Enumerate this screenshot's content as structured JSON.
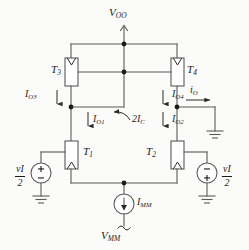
{
  "figure": {
    "type": "circuit-schematic",
    "background_color": "#fbfbf9",
    "line_color": "#5a5a5a",
    "text_color": "#1b1b1b"
  },
  "supplies": {
    "positive_rail": {
      "symbol": "V",
      "subscript": "OO"
    },
    "negative_rail": {
      "symbol": "V",
      "subscript": "MM"
    }
  },
  "transistors": [
    {
      "id": "T3",
      "symbol": "T",
      "subscript": "3",
      "position": "upper-left",
      "arrow": "top"
    },
    {
      "id": "T4",
      "symbol": "T",
      "subscript": "4",
      "position": "upper-right",
      "arrow": "top"
    },
    {
      "id": "T1",
      "symbol": "T",
      "subscript": "1",
      "position": "lower-left",
      "arrow": "bottom"
    },
    {
      "id": "T2",
      "symbol": "T",
      "subscript": "2",
      "position": "lower-right",
      "arrow": "bottom"
    }
  ],
  "currents": [
    {
      "id": "IO3",
      "symbol": "I",
      "subscript": "O3",
      "direction": "down"
    },
    {
      "id": "IO4",
      "symbol": "I",
      "subscript": "O4",
      "direction": "down"
    },
    {
      "id": "IO1",
      "symbol": "I",
      "subscript": "O1",
      "direction": "down"
    },
    {
      "id": "IO2",
      "symbol": "I",
      "subscript": "O2",
      "direction": "down"
    },
    {
      "id": "iO",
      "symbol": "i",
      "subscript": "O",
      "direction": "right"
    },
    {
      "id": "2IC",
      "symbol": "2I",
      "subscript": "C",
      "direction": "curved-left"
    },
    {
      "id": "IMM",
      "symbol": "I",
      "subscript": "MM",
      "direction": "down"
    }
  ],
  "sources": [
    {
      "id": "vin-left",
      "numerator_symbol": "v",
      "numerator_subscript": "I",
      "denominator": "2",
      "top_terminal": "+",
      "bottom_terminal": "−",
      "label_side": "left"
    },
    {
      "id": "vin-right",
      "numerator_symbol": "v",
      "numerator_subscript": "I",
      "denominator": "2",
      "top_terminal": "−",
      "bottom_terminal": "+",
      "label_side": "right"
    }
  ],
  "grounds": [
    {
      "id": "ground-left"
    },
    {
      "id": "ground-right"
    },
    {
      "id": "ground-output"
    }
  ]
}
